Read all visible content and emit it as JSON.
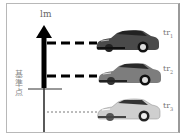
{
  "diagram": {
    "axis_label": "lm",
    "reference_label_chars": [
      "基",
      "準",
      "点"
    ],
    "reference_label": "基準点",
    "cars": [
      {
        "label": "tr",
        "subscript": "1",
        "color": "#4a4a4a",
        "line_style": "thick-dashed"
      },
      {
        "label": "tr",
        "subscript": "2",
        "color": "#7d7d7d",
        "line_style": "thick-dashed"
      },
      {
        "label": "tr",
        "subscript": "3",
        "color": "#c9c9c9",
        "line_style": "thin-dashed"
      }
    ],
    "colors": {
      "axis": "#000000",
      "frame": "#b8b8b8",
      "text": "#777777"
    }
  }
}
